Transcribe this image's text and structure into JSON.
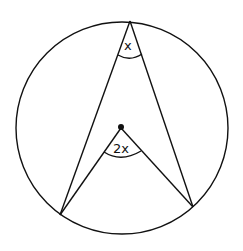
{
  "diagram": {
    "circle": {
      "cx": 122,
      "cy": 128,
      "r": 106
    },
    "points": {
      "top": {
        "x": 130,
        "y": 21
      },
      "center": {
        "x": 121,
        "y": 128
      },
      "left": {
        "x": 60,
        "y": 215
      },
      "right": {
        "x": 193,
        "y": 207
      }
    },
    "labels": {
      "circumference_angle": "x",
      "centre_angle": "2x"
    },
    "colors": {
      "stroke": "#111111",
      "background": "#ffffff"
    }
  }
}
